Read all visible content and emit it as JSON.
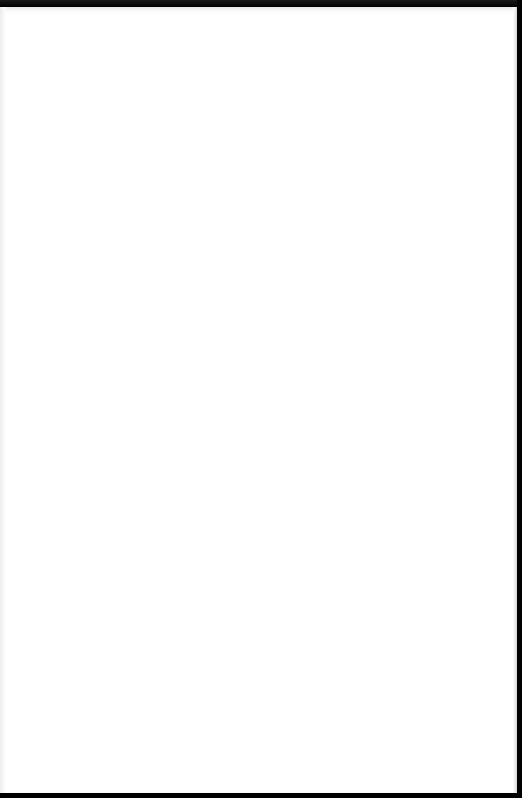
{
  "document": {
    "type": "scanned-page",
    "blank": true,
    "text": "",
    "colors": {
      "paper": "#ffffff",
      "scan_border": "#000000"
    }
  }
}
